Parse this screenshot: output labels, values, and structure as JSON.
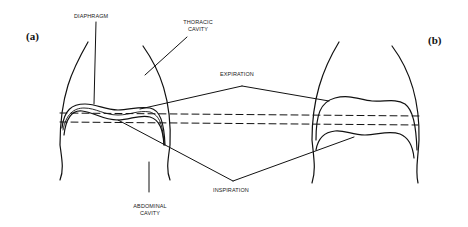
{
  "panels": {
    "a": "(a)",
    "b": "(b)"
  },
  "labels": {
    "diaphragm": "DIAPHRAGM",
    "thoracic_line1": "THORACIC",
    "thoracic_line2": "CAVITY",
    "expiration": "EXPIRATION",
    "inspiration": "INSPIRATION",
    "abdominal_line1": "ABDOMINAL",
    "abdominal_line2": "CAVITY"
  },
  "colors": {
    "line": "#111111",
    "background": "#ffffff"
  }
}
